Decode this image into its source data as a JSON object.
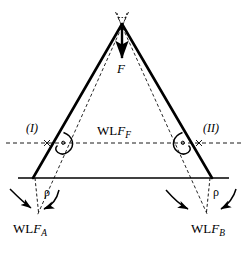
{
  "figure": {
    "type": "statics-force-diagram",
    "background_color": "#ffffff",
    "stroke_color": "#000000"
  },
  "labels": {
    "force_apex": "F",
    "point_left": "(I)",
    "point_right": "(II)",
    "wlf_center_prefix": "WL",
    "wlf_center_italic": "F",
    "wlf_center_sub": "F",
    "wlf_left_prefix": "WL",
    "wlf_left_italic": "F",
    "wlf_left_sub": "A",
    "wlf_right_prefix": "WL",
    "wlf_right_italic": "F",
    "wlf_right_sub": "B",
    "angle_left": "ρ",
    "angle_right": "ρ"
  },
  "geometry": {
    "apex": {
      "x": 122,
      "y": 25
    },
    "base_left": {
      "x": 33,
      "y": 178
    },
    "base_right": {
      "x": 212,
      "y": 178
    },
    "ground_line": {
      "x1": 18,
      "y1": 178,
      "x2": 229,
      "y2": 178
    },
    "wlf_dashed_line": {
      "x1": 6,
      "y1": 143,
      "x2": 241,
      "y2": 143
    },
    "point_I": {
      "x": 47,
      "y": 143
    },
    "point_II": {
      "x": 199,
      "y": 143
    },
    "force_arrow": {
      "x": 122,
      "y1": 28,
      "y2": 60
    }
  },
  "annotations": {
    "angle_marker_left": "reflex-angle-arc",
    "angle_marker_right": "reflex-angle-arc",
    "curved_arrow_left_outer": "moment-arrow",
    "curved_arrow_left_inner": "moment-arrow",
    "curved_arrow_right_outer": "moment-arrow",
    "curved_arrow_right_inner": "moment-arrow"
  }
}
